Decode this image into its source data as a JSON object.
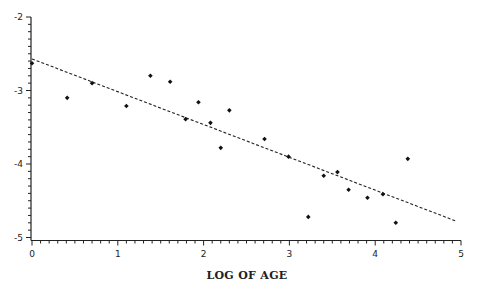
{
  "chart_data": {
    "type": "scatter",
    "title": "",
    "xlabel": "LOG OF AGE",
    "ylabel": "",
    "xlim": [
      0,
      5
    ],
    "ylim": [
      -5,
      -2
    ],
    "x_ticks": [
      0,
      1,
      2,
      3,
      4,
      5
    ],
    "x_tick_labels": [
      "0",
      "1",
      "2",
      "3",
      "4",
      "5"
    ],
    "y_ticks": [
      -2,
      -3,
      -4,
      -5
    ],
    "y_tick_labels": [
      "-2",
      "-3",
      "-4",
      "-5"
    ],
    "minor_tick_step": 0.1,
    "grid": false,
    "legend": null,
    "series": [
      {
        "name": "observations",
        "marker": "diamond",
        "color": "#111111",
        "points": [
          {
            "x": 0.0,
            "y": -2.63
          },
          {
            "x": 0.41,
            "y": -3.1
          },
          {
            "x": 0.7,
            "y": -2.9
          },
          {
            "x": 1.1,
            "y": -3.21
          },
          {
            "x": 1.38,
            "y": -2.8
          },
          {
            "x": 1.61,
            "y": -2.88
          },
          {
            "x": 1.79,
            "y": -3.39
          },
          {
            "x": 1.94,
            "y": -3.16
          },
          {
            "x": 2.08,
            "y": -3.44
          },
          {
            "x": 2.2,
            "y": -3.78
          },
          {
            "x": 2.3,
            "y": -3.27
          },
          {
            "x": 2.71,
            "y": -3.66
          },
          {
            "x": 2.99,
            "y": -3.9
          },
          {
            "x": 3.22,
            "y": -4.72
          },
          {
            "x": 3.4,
            "y": -4.16
          },
          {
            "x": 3.56,
            "y": -4.11
          },
          {
            "x": 3.69,
            "y": -4.35
          },
          {
            "x": 3.91,
            "y": -4.46
          },
          {
            "x": 4.09,
            "y": -4.41
          },
          {
            "x": 4.24,
            "y": -4.8
          },
          {
            "x": 4.38,
            "y": -3.93
          }
        ]
      },
      {
        "name": "fitted line",
        "style": "dashed",
        "color": "#222222",
        "points": [
          {
            "x": 0.0,
            "y": -2.57
          },
          {
            "x": 4.95,
            "y": -4.78
          }
        ]
      }
    ]
  }
}
